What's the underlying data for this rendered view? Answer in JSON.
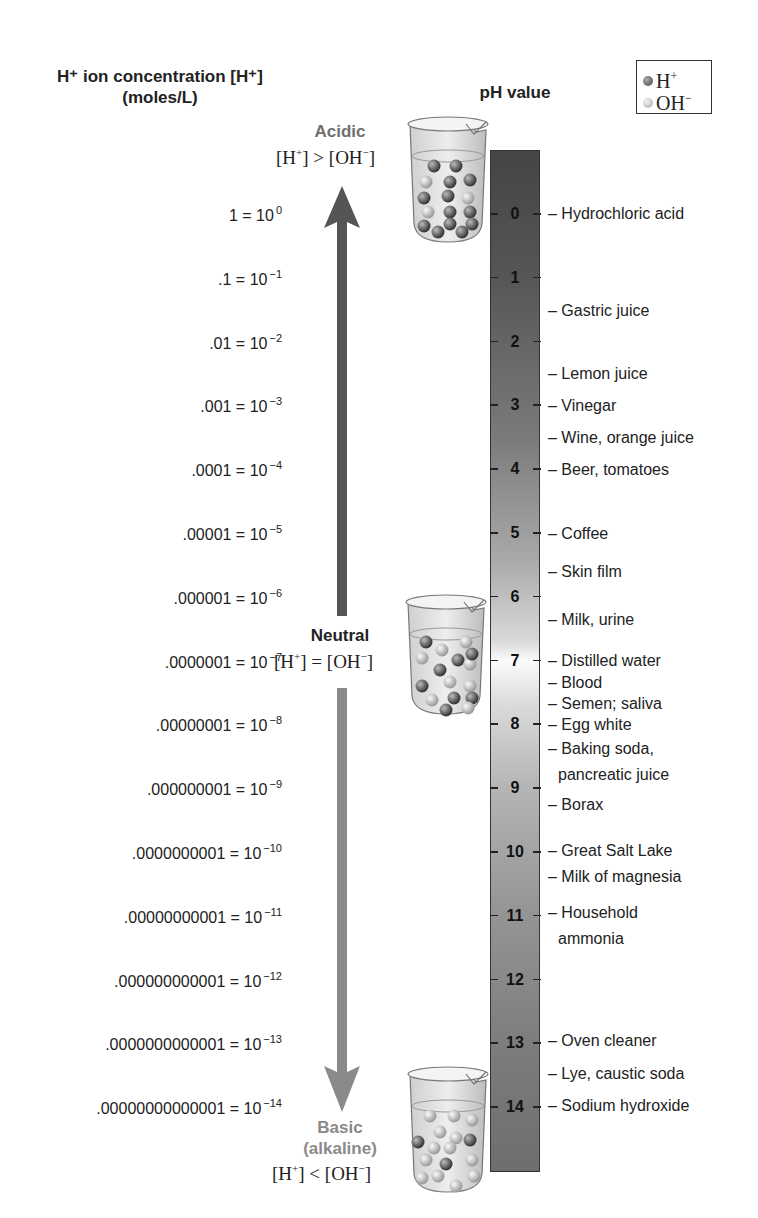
{
  "header": {
    "concentration_title_line1": "H⁺ ion concentration [H⁺]",
    "concentration_title_line2": "(moles/L)",
    "ph_title": "pH value"
  },
  "legend": {
    "items": [
      {
        "label": "H",
        "sup": "+",
        "color": "#5a5a5a"
      },
      {
        "label": "OH",
        "sup": "−",
        "color": "#c4c4c4"
      }
    ]
  },
  "regions": {
    "acidic": {
      "label": "Acidic",
      "condition_left": "[H",
      "condition_right": "] > [OH",
      "condition_end": "]",
      "color": "#6f6f6f"
    },
    "neutral": {
      "label": "Neutral",
      "condition_left": "[H",
      "condition_right": "] = [OH",
      "condition_end": "]",
      "color": "#222222"
    },
    "basic": {
      "label": "Basic",
      "label2": "(alkaline)",
      "condition_left": "[H",
      "condition_right": "] < [OH",
      "condition_end": "]",
      "color": "#8a8a8a"
    }
  },
  "concentrations": [
    {
      "decimal": "1",
      "exp": "0"
    },
    {
      "decimal": ".1",
      "exp": "−1"
    },
    {
      "decimal": ".01",
      "exp": "−2"
    },
    {
      "decimal": ".001",
      "exp": "−3"
    },
    {
      "decimal": ".0001",
      "exp": "−4"
    },
    {
      "decimal": ".00001",
      "exp": "−5"
    },
    {
      "decimal": ".000001",
      "exp": "−6"
    },
    {
      "decimal": ".0000001",
      "exp": "−7"
    },
    {
      "decimal": ".00000001",
      "exp": "−8"
    },
    {
      "decimal": ".000000001",
      "exp": "−9"
    },
    {
      "decimal": ".0000000001",
      "exp": "−10"
    },
    {
      "decimal": ".00000000001",
      "exp": "−11"
    },
    {
      "decimal": ".000000000001",
      "exp": "−12"
    },
    {
      "decimal": ".0000000000001",
      "exp": "−13"
    },
    {
      "decimal": ".00000000000001",
      "exp": "−14"
    }
  ],
  "ph_ticks": [
    "0",
    "1",
    "2",
    "3",
    "4",
    "5",
    "6",
    "7",
    "8",
    "9",
    "10",
    "11",
    "12",
    "13",
    "14"
  ],
  "substances": [
    {
      "name": "– Hydrochloric acid",
      "y": 204
    },
    {
      "name": "– Gastric juice",
      "y": 301
    },
    {
      "name": "– Lemon juice",
      "y": 364
    },
    {
      "name": "– Vinegar",
      "y": 396
    },
    {
      "name": "– Wine, orange juice",
      "y": 428
    },
    {
      "name": "– Beer, tomatoes",
      "y": 460
    },
    {
      "name": "– Coffee",
      "y": 524
    },
    {
      "name": "– Skin film",
      "y": 562
    },
    {
      "name": "– Milk, urine",
      "y": 610
    },
    {
      "name": "– Distilled water",
      "y": 651
    },
    {
      "name": "– Blood",
      "y": 673
    },
    {
      "name": "– Semen; saliva",
      "y": 694
    },
    {
      "name": "– Egg white",
      "y": 715
    },
    {
      "name": "– Baking soda,",
      "y": 739
    },
    {
      "name": "pancreatic juice",
      "y": 765,
      "indent": true
    },
    {
      "name": "– Borax",
      "y": 795
    },
    {
      "name": "– Great Salt Lake",
      "y": 841
    },
    {
      "name": "– Milk of magnesia",
      "y": 867
    },
    {
      "name": "– Household",
      "y": 903
    },
    {
      "name": "ammonia",
      "y": 929,
      "indent": true
    },
    {
      "name": "– Oven cleaner",
      "y": 1031
    },
    {
      "name": "– Lye, caustic soda",
      "y": 1064
    },
    {
      "name": "– Sodium hydroxide",
      "y": 1096
    }
  ],
  "chart_data": {
    "type": "table",
    "columns": [
      "H+ ion concentration (moles/L)",
      "pH value"
    ],
    "rows": [
      [
        "1 = 10^0",
        0
      ],
      [
        ".1 = 10^-1",
        1
      ],
      [
        ".01 = 10^-2",
        2
      ],
      [
        ".001 = 10^-3",
        3
      ],
      [
        ".0001 = 10^-4",
        4
      ],
      [
        ".00001 = 10^-5",
        5
      ],
      [
        ".000001 = 10^-6",
        6
      ],
      [
        ".0000001 = 10^-7",
        7
      ],
      [
        ".00000001 = 10^-8",
        8
      ],
      [
        ".000000001 = 10^-9",
        9
      ],
      [
        ".0000000001 = 10^-10",
        10
      ],
      [
        ".00000000001 = 10^-11",
        11
      ],
      [
        ".000000000001 = 10^-12",
        12
      ],
      [
        ".0000000000001 = 10^-13",
        13
      ],
      [
        ".00000000000001 = 10^-14",
        14
      ]
    ],
    "annotations": {
      "Hydrochloric acid": 0,
      "Gastric juice": 1.5,
      "Lemon juice": 2.5,
      "Vinegar": 3,
      "Wine, orange juice": 3.5,
      "Beer, tomatoes": 4,
      "Coffee": 5,
      "Skin film": 5.6,
      "Milk, urine": 6.3,
      "Distilled water": 7,
      "Blood": 7.35,
      "Semen; saliva": 7.7,
      "Egg white": 8,
      "Baking soda, pancreatic juice": 8.5,
      "Borax": 9.2,
      "Great Salt Lake": 10,
      "Milk of magnesia": 10.4,
      "Household ammonia": 11,
      "Oven cleaner": 13,
      "Lye, caustic soda": 13.5,
      "Sodium hydroxide": 14
    }
  }
}
